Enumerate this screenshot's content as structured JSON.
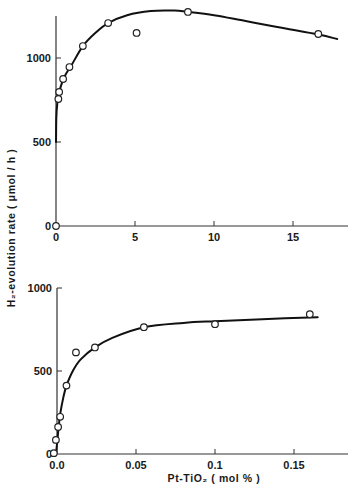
{
  "figure": {
    "y_axis_title": "H₂-evolution rate ( μmol / h )",
    "x_axis_title": "Pt-TiO₂ ( mol % )"
  },
  "chart_data": [
    {
      "type": "scatter",
      "panel": "top",
      "title": "",
      "xlabel": "",
      "ylabel": "H2-evolution rate (μmol/h)",
      "xlim": [
        0,
        18.5
      ],
      "ylim": [
        0,
        1290
      ],
      "grid": false,
      "legend": null,
      "xticks": [
        0,
        5,
        10,
        15
      ],
      "xtick_labels": [
        "0",
        "5",
        "10",
        "15"
      ],
      "yticks": [
        0,
        500,
        1000
      ],
      "ytick_labels": [
        "0",
        "500",
        "1000"
      ],
      "series": [
        {
          "name": "measured",
          "marker": "open-circle",
          "x": [
            0,
            0.15,
            0.2,
            0.45,
            0.85,
            1.7,
            3.3,
            5.1,
            8.35,
            16.6
          ],
          "y": [
            0,
            756,
            798,
            875,
            946,
            1071,
            1208,
            1149,
            1274,
            1143
          ]
        },
        {
          "name": "fitted-curve",
          "style": "solid-line",
          "x": [
            0,
            0.02,
            0.08,
            0.15,
            0.3,
            0.6,
            1.0,
            1.7,
            2.5,
            3.3,
            4.5,
            6.0,
            7.5,
            8.35,
            10,
            12,
            14,
            16.6,
            17.8
          ],
          "y": [
            500,
            640,
            730,
            770,
            830,
            900,
            960,
            1071,
            1150,
            1208,
            1255,
            1280,
            1282,
            1274,
            1255,
            1220,
            1185,
            1140,
            1113
          ]
        }
      ]
    },
    {
      "type": "scatter",
      "panel": "bottom",
      "title": "",
      "xlabel": "Pt-TiO2 (mol %)",
      "ylabel": "H2-evolution rate (μmol/h)",
      "xlim": [
        0,
        0.185
      ],
      "ylim": [
        0,
        1000
      ],
      "grid": false,
      "legend": null,
      "xticks": [
        0.0,
        0.05,
        0.1,
        0.15
      ],
      "xtick_labels": [
        "0.0",
        "0.05",
        "0.1",
        "0.15"
      ],
      "yticks": [
        0,
        500,
        1000
      ],
      "ytick_labels": [
        "0",
        "500",
        "1000"
      ],
      "series": [
        {
          "name": "measured",
          "marker": "open-circle",
          "x": [
            -0.002,
            -0.0007,
            0.0007,
            0.002,
            0.006,
            0.012,
            0.024,
            0.055,
            0.1,
            0.16
          ],
          "y": [
            5,
            85,
            163,
            224,
            412,
            612,
            642,
            764,
            782,
            842
          ]
        },
        {
          "name": "fitted-curve",
          "style": "solid-line",
          "x": [
            -0.0007,
            0.0,
            0.001,
            0.002,
            0.004,
            0.006,
            0.01,
            0.015,
            0.024,
            0.035,
            0.055,
            0.08,
            0.1,
            0.13,
            0.165
          ],
          "y": [
            0,
            60,
            160,
            240,
            340,
            412,
            500,
            570,
            642,
            700,
            764,
            790,
            800,
            812,
            824
          ]
        }
      ]
    }
  ]
}
